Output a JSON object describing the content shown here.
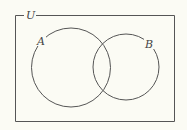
{
  "diagram": {
    "type": "venn",
    "universe": {
      "label": "U"
    },
    "sets": [
      {
        "label": "A"
      },
      {
        "label": "B"
      }
    ],
    "colors": {
      "background": "#fbfbf4",
      "stroke": "#555555",
      "text": "#444444"
    }
  }
}
